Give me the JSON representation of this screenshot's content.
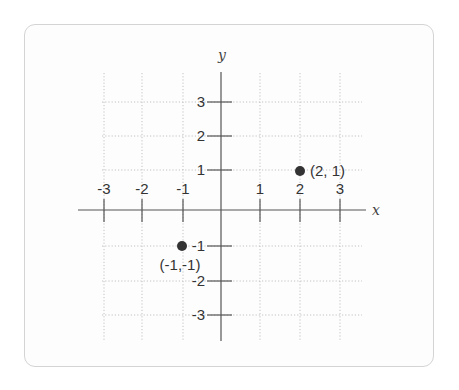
{
  "figure": {
    "x_axis_label": "x",
    "y_axis_label": "y",
    "x_ticks": [
      {
        "value": -3,
        "label": "-3",
        "px": 104
      },
      {
        "value": -2,
        "label": "-2",
        "px": 142
      },
      {
        "value": -1,
        "label": "-1",
        "px": 183
      },
      {
        "value": 1,
        "label": "1",
        "px": 260
      },
      {
        "value": 2,
        "label": "2",
        "px": 300
      },
      {
        "value": 3,
        "label": "3",
        "px": 340
      }
    ],
    "y_ticks": [
      {
        "value": 3,
        "label": "3",
        "py": 102
      },
      {
        "value": 2,
        "label": "2",
        "py": 136
      },
      {
        "value": 1,
        "label": "1",
        "py": 170
      },
      {
        "value": -1,
        "label": "-1",
        "py": 246
      },
      {
        "value": -2,
        "label": "-2",
        "py": 281
      },
      {
        "value": -3,
        "label": "-3",
        "py": 315
      }
    ],
    "origin": {
      "px": 221,
      "py": 210
    },
    "points": [
      {
        "x": 2,
        "y": 1,
        "label": "(2, 1)",
        "px": 300,
        "py": 171,
        "label_dx": 10,
        "label_dy": 5,
        "anchor": "start"
      },
      {
        "x": -1,
        "y": -1,
        "label": "(-1,-1)",
        "px": 182,
        "py": 246,
        "label_dx": -2,
        "label_dy": 24,
        "anchor": "middle"
      }
    ],
    "grid": {
      "x_min": 102,
      "x_max": 362,
      "y_min": 73,
      "y_max": 340
    },
    "colors": {
      "grid": "#c2c2c2",
      "axis": "#555555",
      "point": "#333333",
      "card_border": "#d4d4d4"
    }
  }
}
